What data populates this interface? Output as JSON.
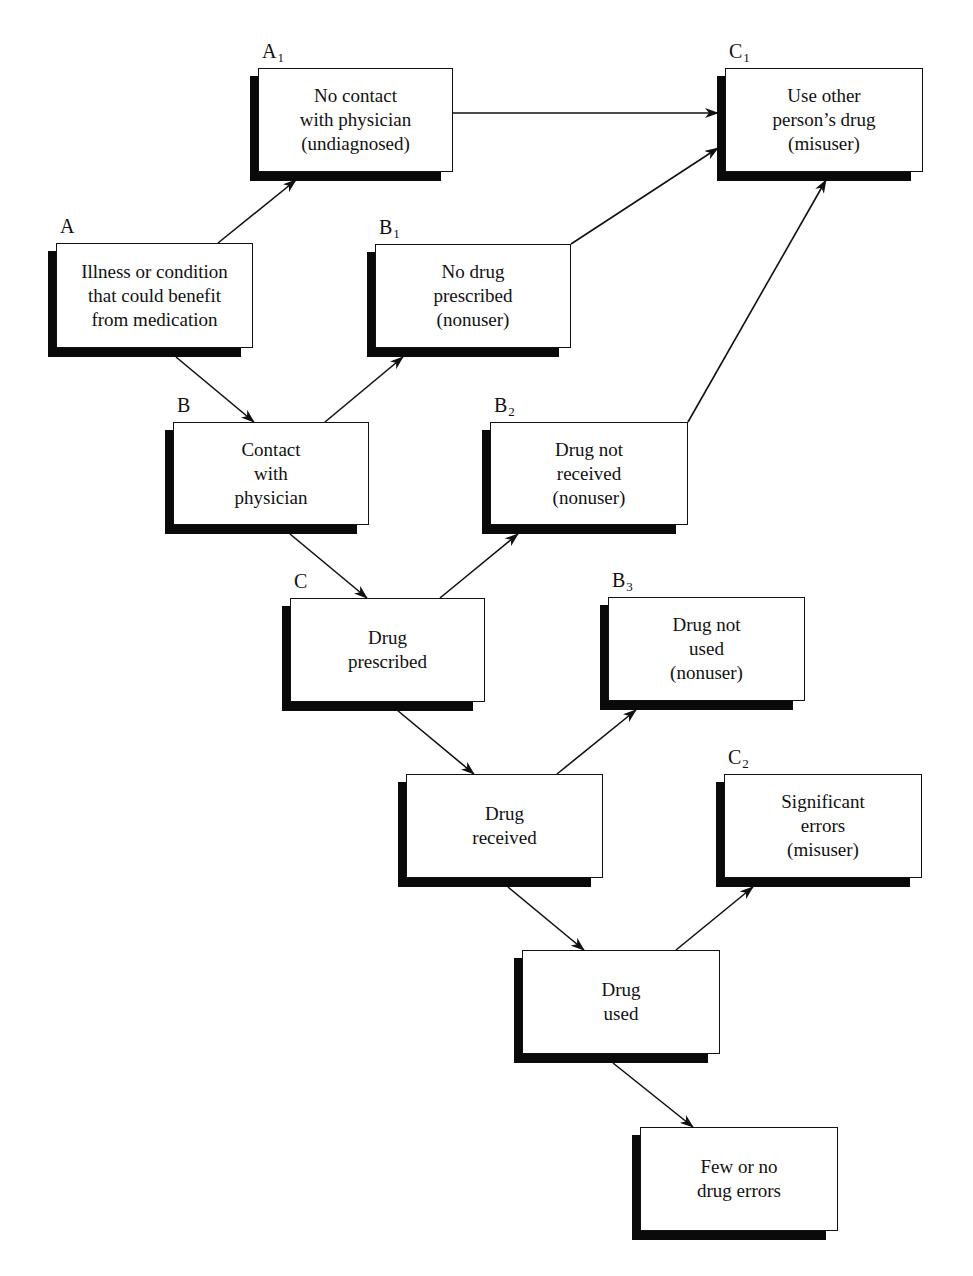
{
  "diagram": {
    "nodes": [
      {
        "id": "A",
        "label": "A",
        "sub": "",
        "text": "Illness or condition\nthat could benefit\nfrom medication",
        "x": 56,
        "y": 243,
        "w": 197,
        "h": 105
      },
      {
        "id": "A1",
        "label": "A",
        "sub": "1",
        "text": "No contact\nwith physician\n(undiagnosed)",
        "x": 258,
        "y": 68,
        "w": 195,
        "h": 104
      },
      {
        "id": "C1",
        "label": "C",
        "sub": "1",
        "text": "Use other\nperson’s drug\n(misuser)",
        "x": 725,
        "y": 68,
        "w": 198,
        "h": 104
      },
      {
        "id": "B1",
        "label": "B",
        "sub": "1",
        "text": "No drug\nprescribed\n(nonuser)",
        "x": 375,
        "y": 244,
        "w": 196,
        "h": 104
      },
      {
        "id": "B",
        "label": "B",
        "sub": "",
        "text": "Contact\nwith\nphysician",
        "x": 173,
        "y": 422,
        "w": 196,
        "h": 103
      },
      {
        "id": "B2",
        "label": "B",
        "sub": "2",
        "text": "Drug not\nreceived\n(nonuser)",
        "x": 490,
        "y": 422,
        "w": 198,
        "h": 103
      },
      {
        "id": "C",
        "label": "C",
        "sub": "",
        "text": "Drug\nprescribed",
        "x": 290,
        "y": 598,
        "w": 195,
        "h": 104
      },
      {
        "id": "B3",
        "label": "B",
        "sub": "3",
        "text": "Drug not\nused\n(nonuser)",
        "x": 608,
        "y": 597,
        "w": 197,
        "h": 104
      },
      {
        "id": "D",
        "label": "",
        "sub": "",
        "text": "Drug\nreceived",
        "x": 406,
        "y": 774,
        "w": 197,
        "h": 104
      },
      {
        "id": "C2",
        "label": "C",
        "sub": "2",
        "text": "Significant\nerrors\n(misuser)",
        "x": 724,
        "y": 774,
        "w": 198,
        "h": 104
      },
      {
        "id": "E",
        "label": "",
        "sub": "",
        "text": "Drug\nused",
        "x": 522,
        "y": 950,
        "w": 198,
        "h": 104
      },
      {
        "id": "F",
        "label": "",
        "sub": "",
        "text": "Few or no\ndrug errors",
        "x": 640,
        "y": 1127,
        "w": 198,
        "h": 104
      }
    ],
    "edges": [
      {
        "from": "A",
        "to": "A1",
        "x1": 218,
        "y1": 243,
        "x2": 296,
        "y2": 180
      },
      {
        "from": "A",
        "to": "B",
        "x1": 176,
        "y1": 357,
        "x2": 254,
        "y2": 422
      },
      {
        "from": "A1",
        "to": "C1",
        "x1": 453,
        "y1": 113,
        "x2": 718,
        "y2": 113
      },
      {
        "from": "B1",
        "to": "C1",
        "x1": 571,
        "y1": 244,
        "x2": 718,
        "y2": 148
      },
      {
        "from": "B",
        "to": "B1",
        "x1": 325,
        "y1": 422,
        "x2": 403,
        "y2": 357
      },
      {
        "from": "B",
        "to": "C",
        "x1": 290,
        "y1": 534,
        "x2": 367,
        "y2": 598
      },
      {
        "from": "B2",
        "to": "C1",
        "x1": 688,
        "y1": 422,
        "x2": 826,
        "y2": 180
      },
      {
        "from": "C",
        "to": "B2",
        "x1": 440,
        "y1": 598,
        "x2": 518,
        "y2": 534
      },
      {
        "from": "C",
        "to": "D",
        "x1": 397,
        "y1": 710,
        "x2": 474,
        "y2": 774
      },
      {
        "from": "D",
        "to": "B3",
        "x1": 557,
        "y1": 774,
        "x2": 636,
        "y2": 710
      },
      {
        "from": "D",
        "to": "E",
        "x1": 508,
        "y1": 887,
        "x2": 584,
        "y2": 950
      },
      {
        "from": "E",
        "to": "C2",
        "x1": 676,
        "y1": 950,
        "x2": 753,
        "y2": 887
      },
      {
        "from": "E",
        "to": "F",
        "x1": 613,
        "y1": 1063,
        "x2": 693,
        "y2": 1127
      }
    ],
    "colors": {
      "line": "#111111",
      "shadow": "#0a0a0a",
      "box": "#ffffff"
    }
  }
}
